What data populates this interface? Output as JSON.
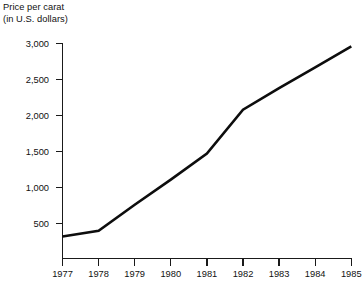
{
  "chart_data": {
    "type": "line",
    "title": "Price per carat (in U.S. dollars)",
    "title_lines": [
      "Price per carat",
      "(in U.S. dollars)"
    ],
    "xlabel": "",
    "ylabel": "Price per carat (in U.S. dollars)",
    "x": [
      1977,
      1978,
      1979,
      1980,
      1981,
      1982,
      1983,
      1984,
      1985
    ],
    "categories": [
      "1977",
      "1978",
      "1979",
      "1980",
      "1981",
      "1982",
      "1983",
      "1984",
      "1985"
    ],
    "values": [
      320,
      400,
      760,
      1110,
      1470,
      2080,
      2380,
      2670,
      2960
    ],
    "series": [
      {
        "name": "Price per carat",
        "values": [
          320,
          400,
          760,
          1110,
          1470,
          2080,
          2380,
          2670,
          2960
        ]
      }
    ],
    "ylim": [
      0,
      3000
    ],
    "xlim": [
      1977,
      1985
    ],
    "yticks": [
      500,
      1000,
      1500,
      2000,
      2500,
      3000
    ],
    "ytick_labels": [
      "500",
      "1,000",
      "1,500",
      "2,000",
      "2,500",
      "3,000"
    ],
    "xticks": [
      1977,
      1978,
      1979,
      1980,
      1981,
      1982,
      1983,
      1984,
      1985
    ],
    "xtick_labels": [
      "1977",
      "1978",
      "1979",
      "1980",
      "1981",
      "1982",
      "1983",
      "1984",
      "1985"
    ],
    "grid": false,
    "legend": false,
    "legend_position": "none",
    "line_color": "#0d0d0d",
    "axis_color": "#1a1a1a",
    "background_color": "#ffffff"
  }
}
